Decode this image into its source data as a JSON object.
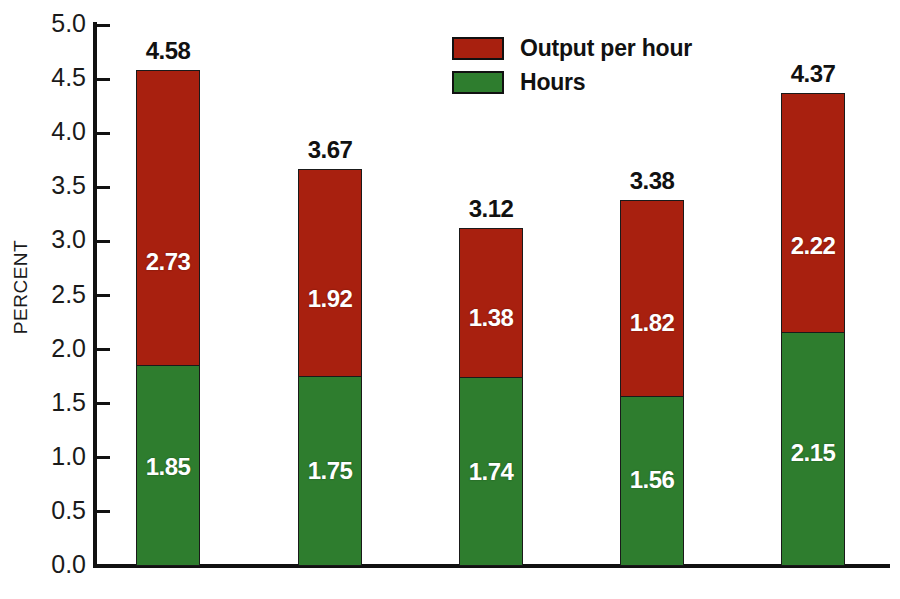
{
  "chart_data": {
    "type": "bar",
    "subtype": "stacked-bar",
    "title": "",
    "xlabel": "",
    "ylabel": "PERCENT",
    "ylim": [
      0.0,
      5.0
    ],
    "ytick_step": 0.5,
    "grid": false,
    "legend_position": "top-center",
    "categories": [
      "1960–1969",
      "1970–1979",
      "1980–1989",
      "1990–1995",
      "1995–2000"
    ],
    "ytick_labels": [
      "0.0",
      "0.5",
      "1.0",
      "1.5",
      "2.0",
      "2.5",
      "3.0",
      "3.5",
      "4.0",
      "4.5",
      "5.0"
    ],
    "ytick_values": [
      0.0,
      0.5,
      1.0,
      1.5,
      2.0,
      2.5,
      3.0,
      3.5,
      4.0,
      4.5,
      5.0
    ],
    "series": [
      {
        "name": "Hours",
        "color": "#2E7D2E",
        "values": [
          1.85,
          1.75,
          1.74,
          1.56,
          2.15
        ],
        "labels": [
          "1.85",
          "1.75",
          "1.74",
          "1.56",
          "2.15"
        ]
      },
      {
        "name": "Output per hour",
        "color": "#A8200F",
        "values": [
          2.73,
          1.92,
          1.38,
          1.82,
          2.22
        ],
        "labels": [
          "2.73",
          "1.92",
          "1.38",
          "1.82",
          "2.22"
        ]
      }
    ],
    "totals": [
      4.58,
      3.67,
      3.12,
      3.38,
      4.37
    ],
    "total_labels": [
      "4.58",
      "3.67",
      "3.12",
      "3.38",
      "4.37"
    ]
  },
  "legend": {
    "items": [
      {
        "label": "Output per hour",
        "color": "#A8200F"
      },
      {
        "label": "Hours",
        "color": "#2E7D2E"
      }
    ]
  },
  "colors": {
    "output_per_hour": "#A8200F",
    "hours": "#2E7D2E",
    "axis": "#111111",
    "background": "#FFFFFF",
    "text": "#1A1A1A",
    "value_label_on_bar": "#FFFFFF"
  }
}
